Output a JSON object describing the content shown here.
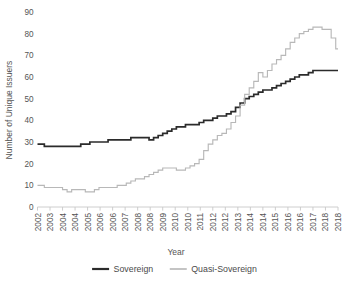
{
  "chart_data": {
    "type": "line",
    "title": "",
    "subtitle": "",
    "xlabel": "Year",
    "ylabel": "Number of Unique Issuers",
    "ylim": [
      0,
      90
    ],
    "yticks": [
      0,
      10,
      20,
      30,
      40,
      50,
      60,
      70,
      80,
      90
    ],
    "grid": false,
    "legend_position": "bottom-center",
    "x_tick_labels": [
      "2002",
      "2003",
      "2004",
      "2004",
      "2005",
      "2006",
      "2006",
      "2007",
      "2008",
      "2008",
      "2009",
      "2010",
      "2010",
      "2011",
      "2012",
      "2012",
      "2013",
      "2014",
      "2014",
      "2015",
      "2016",
      "2016",
      "2017",
      "2018",
      "2018"
    ],
    "x_start": 2002.0,
    "x_end": 2018.5,
    "x_step": 0.5,
    "x": [
      2002.0,
      2002.25,
      2002.5,
      2002.75,
      2003.0,
      2003.25,
      2003.5,
      2003.75,
      2004.0,
      2004.25,
      2004.5,
      2004.75,
      2005.0,
      2005.25,
      2005.5,
      2005.75,
      2006.0,
      2006.25,
      2006.5,
      2006.75,
      2007.0,
      2007.25,
      2007.5,
      2007.75,
      2008.0,
      2008.25,
      2008.5,
      2008.75,
      2009.0,
      2009.25,
      2009.5,
      2009.75,
      2010.0,
      2010.25,
      2010.5,
      2010.75,
      2011.0,
      2011.25,
      2011.5,
      2011.75,
      2012.0,
      2012.25,
      2012.5,
      2012.75,
      2013.0,
      2013.25,
      2013.5,
      2013.75,
      2014.0,
      2014.25,
      2014.5,
      2014.75,
      2015.0,
      2015.25,
      2015.5,
      2015.75,
      2016.0,
      2016.25,
      2016.5,
      2016.75,
      2017.0,
      2017.25,
      2017.5,
      2017.75,
      2018.0,
      2018.25,
      2018.5
    ],
    "series": [
      {
        "name": "Sovereign",
        "color": "#2b2b2b",
        "values": [
          29,
          29,
          28,
          28,
          28,
          28,
          28,
          28,
          28,
          28,
          29,
          29,
          30,
          30,
          30,
          30,
          31,
          31,
          31,
          31,
          31,
          32,
          32,
          32,
          32,
          31,
          32,
          33,
          34,
          35,
          36,
          37,
          37,
          38,
          38,
          38,
          39,
          40,
          40,
          41,
          42,
          42,
          43,
          44,
          46,
          48,
          50,
          51,
          52,
          53,
          54,
          54,
          55,
          56,
          57,
          58,
          59,
          60,
          61,
          61,
          62,
          63,
          63,
          63,
          63,
          63,
          63
        ]
      },
      {
        "name": "Quasi-Sovereign",
        "color": "#b8b8b8",
        "values": [
          10,
          10,
          9,
          9,
          9,
          9,
          8,
          7,
          8,
          8,
          8,
          7,
          7,
          8,
          9,
          9,
          9,
          9,
          10,
          10,
          11,
          12,
          13,
          13,
          14,
          15,
          16,
          17,
          18,
          18,
          18,
          17,
          17,
          18,
          19,
          20,
          22,
          26,
          29,
          31,
          33,
          34,
          36,
          39,
          42,
          47,
          52,
          55,
          58,
          62,
          60,
          63,
          66,
          68,
          70,
          73,
          76,
          78,
          80,
          81,
          82,
          83,
          83,
          82,
          82,
          78,
          73
        ]
      }
    ]
  },
  "legend": {
    "items": [
      {
        "label": "Sovereign"
      },
      {
        "label": "Quasi-Sovereign"
      }
    ]
  }
}
